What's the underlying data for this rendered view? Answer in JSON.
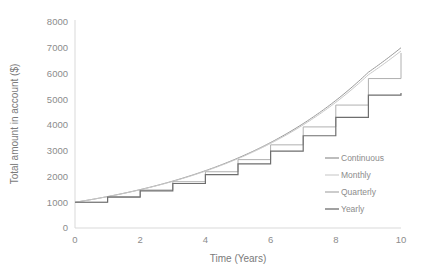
{
  "chart_data": {
    "type": "line",
    "title": "",
    "xlabel": "Time (Years)",
    "ylabel": "Total amount in account ($)",
    "xlim": [
      0,
      10
    ],
    "ylim": [
      0,
      8000
    ],
    "xticks": [
      0,
      2,
      4,
      6,
      8,
      10
    ],
    "yticks": [
      0,
      1000,
      2000,
      3000,
      4000,
      5000,
      6000,
      7000,
      8000
    ],
    "xtick_labels": [
      "0",
      "2",
      "4",
      "6",
      "8",
      "10"
    ],
    "ytick_labels": [
      "0",
      "1000",
      "2000",
      "3000",
      "4000",
      "5000",
      "6000",
      "7000",
      "8000"
    ],
    "grid": false,
    "legend_position": "right-inside",
    "principal": 1000,
    "annual_rate_percent": 20,
    "x": [
      0,
      1,
      2,
      3,
      4,
      5,
      6,
      7,
      8,
      9,
      10
    ],
    "series": [
      {
        "name": "Continuous",
        "style": "smooth",
        "color": "#9a9a9a",
        "width": 1.0,
        "values": [
          1000,
          1221,
          1492,
          1822,
          2226,
          2718,
          3320,
          4055,
          4953,
          6050,
          7000
        ]
      },
      {
        "name": "Monthly",
        "style": "smooth",
        "color": "#c8c8c8",
        "width": 1.0,
        "values": [
          1000,
          1219,
          1486,
          1812,
          2209,
          2694,
          3284,
          4004,
          4881,
          5951,
          6875
        ]
      },
      {
        "name": "Quarterly",
        "style": "step",
        "color": "#b0b0b0",
        "width": 1.0,
        "values": [
          1000,
          1216,
          1478,
          1797,
          2185,
          2656,
          3229,
          3926,
          4774,
          5804,
          6800
        ]
      },
      {
        "name": "Yearly",
        "style": "step",
        "color": "#6e6e6e",
        "width": 1.2,
        "values": [
          1000,
          1200,
          1440,
          1728,
          2074,
          2488,
          2986,
          3583,
          4300,
          5160,
          5243
        ]
      }
    ],
    "legend_entries": [
      {
        "label": "Continuous",
        "color": "#9a9a9a"
      },
      {
        "label": "Monthly",
        "color": "#d2d2d2"
      },
      {
        "label": "Quarterly",
        "color": "#b0b0b0"
      },
      {
        "label": "Yearly",
        "color": "#6e6e6e"
      }
    ]
  }
}
